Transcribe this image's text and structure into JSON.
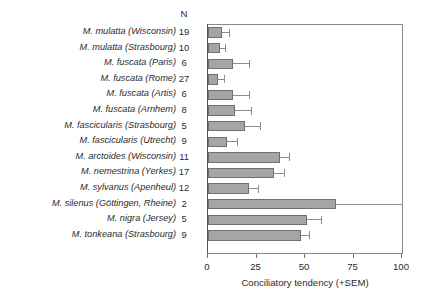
{
  "chart_data": {
    "type": "bar",
    "orientation": "horizontal",
    "title": "",
    "xlabel": "Conciliatory tendency (+SEM)",
    "ylabel": "",
    "xlim": [
      0,
      100
    ],
    "xticks": [
      0,
      25,
      50,
      75,
      100
    ],
    "xticklabels": [
      "0",
      "25",
      "50",
      "75",
      "100"
    ],
    "grid": false,
    "legend": null,
    "n_column_header": "N",
    "categories": [
      "M. mulatta (Wisconsin)",
      "M. mulatta (Strasbourg)",
      "M. fuscata (Paris)",
      "M. fuscata (Rome)",
      "M. fuscata (Artis)",
      "M. fuscata (Arnhem)",
      "M. fascicularis (Strasbourg)",
      "M. fascicularis (Utrecht)",
      "M. arctoides (Wisconsin)",
      "M. nemestrina (Yerkes)",
      "M. sylvanus (Apenheul)",
      "M. silenus (Göttingen, Rheine)",
      "M. nigra (Jersey)",
      "M. tonkeana (Strasbourg)"
    ],
    "n_values": [
      19,
      10,
      6,
      27,
      6,
      8,
      5,
      9,
      11,
      17,
      12,
      2,
      5,
      9
    ],
    "values": [
      7,
      6,
      13,
      5,
      13,
      14,
      19,
      10,
      37,
      34,
      21,
      66,
      51,
      48
    ],
    "sem": [
      4,
      3,
      8,
      3,
      8,
      8,
      8,
      5,
      5,
      5,
      5,
      34,
      7,
      4
    ],
    "bar_color": "#a5a5a5",
    "bar_edge_color": "#6f6f6f",
    "error_color": "#8d8d8d"
  }
}
